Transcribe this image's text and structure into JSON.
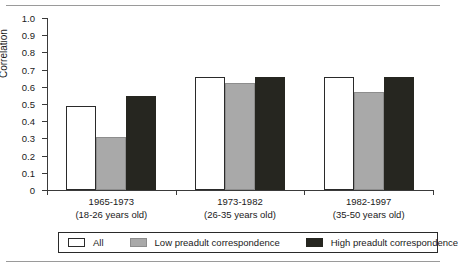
{
  "chart_data": {
    "type": "bar",
    "title": "",
    "xlabel": "",
    "ylabel": "Correlation",
    "ylim": [
      0,
      1.0
    ],
    "ytick_labels": [
      "1.0",
      "0.9",
      "0.8",
      "0.7",
      "0.6",
      "0.5",
      "0.4",
      "0.3",
      "0.2",
      "0.1",
      "0"
    ],
    "ytick_values": [
      1.0,
      0.9,
      0.8,
      0.7,
      0.6,
      0.5,
      0.4,
      0.3,
      0.2,
      0.1,
      0
    ],
    "grid": false,
    "legend_position": "bottom",
    "categories": [
      "1965-1973",
      "1973-1982",
      "1982-1997"
    ],
    "category_sublabels": [
      "(18-26 years old)",
      "(26-35 years old)",
      "(35-50 years old)"
    ],
    "series": [
      {
        "name": "All",
        "color": "#ffffff",
        "values": [
          0.49,
          0.655,
          0.655
        ]
      },
      {
        "name": "Low preadult correspondence",
        "color": "#a9a9a9",
        "values": [
          0.31,
          0.625,
          0.57
        ]
      },
      {
        "name": "High preadult correspondence",
        "color": "#262620",
        "values": [
          0.545,
          0.655,
          0.655
        ]
      }
    ]
  },
  "legend": {
    "items": [
      {
        "label": "All"
      },
      {
        "label": "Low preadult correspondence"
      },
      {
        "label": "High preadult correspondence"
      }
    ]
  }
}
